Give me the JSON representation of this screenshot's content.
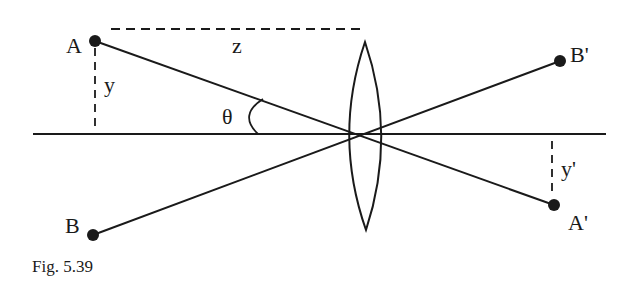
{
  "figure": {
    "caption": "Fig. 5.39",
    "type": "thin lens imaging diagram",
    "colors": {
      "ink": "#1a1a1a",
      "background": "#ffffff"
    }
  },
  "labels": {
    "object_top": "A",
    "object_bottom": "B",
    "image_top": "B'",
    "image_bottom": "A'",
    "object_height": "y",
    "image_height": "y'",
    "object_distance": "z",
    "angle": "θ"
  },
  "geometry": {
    "axis": {
      "x1": 33,
      "x2": 606,
      "y": 134
    },
    "lens_center": {
      "x": 361,
      "y": 134
    },
    "points": {
      "A": {
        "x": 95,
        "y": 41
      },
      "B": {
        "x": 93,
        "y": 235
      },
      "B_prime": {
        "x": 560,
        "y": 61
      },
      "A_prime": {
        "x": 554,
        "y": 205
      }
    }
  }
}
